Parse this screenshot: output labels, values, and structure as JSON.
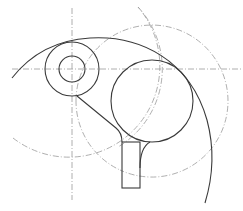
{
  "figure": {
    "colors": {
      "outline": "#3a3a3a",
      "construction": "#9a9a9a",
      "background": "#ffffff"
    },
    "elements": [
      "small-inner-circle",
      "small-outer-circle",
      "large-circle",
      "outer-profile-arc",
      "tangent-line",
      "fillet-arc",
      "shank-rectangle",
      "horizontal-centerline",
      "vertical-centerline",
      "construction-circle-left",
      "construction-circle-right"
    ]
  }
}
